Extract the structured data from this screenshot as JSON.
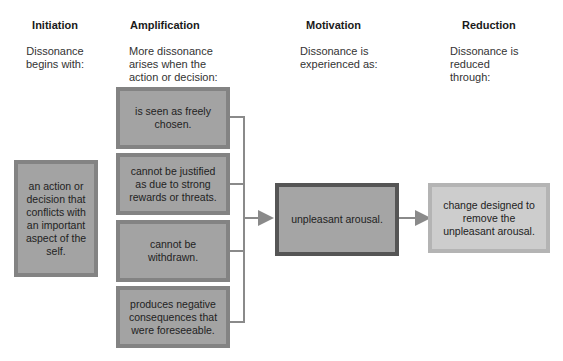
{
  "columns": [
    {
      "title": "Initiation",
      "subtitle": "Dissonance begins with:"
    },
    {
      "title": "Amplification",
      "subtitle": "More dissonance arises when the action or decision:"
    },
    {
      "title": "Motivation",
      "subtitle": "Dissonance is experienced as:"
    },
    {
      "title": "Reduction",
      "subtitle": "Dissonance is reduced through:"
    }
  ],
  "initiation_box": "an action or decision that conflicts with an important aspect of the self.",
  "amplification_boxes": [
    "is seen as freely chosen.",
    "cannot be justified as due to strong rewards or threats.",
    "cannot be withdrawn.",
    "produces negative consequences that were foreseeable."
  ],
  "motivation_box": "unpleasant arousal.",
  "reduction_box": "change designed to remove the unpleasant arousal.",
  "colors": {
    "box_fill": "#a3a3a3",
    "box_border": "#838383",
    "motivation_border": "#555555",
    "reduction_fill": "#cdcdcd",
    "connector": "#8a8a8a"
  }
}
